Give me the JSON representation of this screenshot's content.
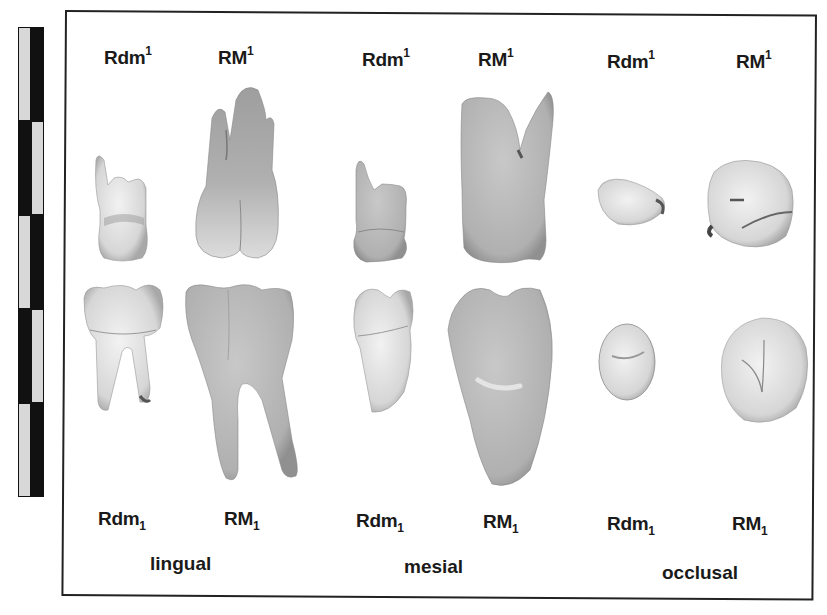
{
  "figure": {
    "scale_bar": {
      "segments": 5,
      "colors": {
        "dark": "#111111",
        "light": "#d8d8d8"
      }
    },
    "upper_labels": [
      {
        "base": "Rdm",
        "sup": "1"
      },
      {
        "base": "RM",
        "sup": "1"
      },
      {
        "base": "Rdm",
        "sup": "1"
      },
      {
        "base": "RM",
        "sup": "1"
      },
      {
        "base": "Rdm",
        "sup": "1"
      },
      {
        "base": "RM",
        "sup": "1"
      }
    ],
    "lower_labels": [
      {
        "base": "Rdm",
        "sub": "1"
      },
      {
        "base": "RM",
        "sub": "1"
      },
      {
        "base": "Rdm",
        "sub": "1"
      },
      {
        "base": "RM",
        "sub": "1"
      },
      {
        "base": "Rdm",
        "sub": "1"
      },
      {
        "base": "RM",
        "sub": "1"
      }
    ],
    "views": [
      {
        "label": "lingual"
      },
      {
        "label": "mesial"
      },
      {
        "label": "occlusal"
      }
    ],
    "specimens": [
      {
        "name": "Rdm1 upper deciduous molar",
        "view": "lingual",
        "row": "upper"
      },
      {
        "name": "RM1 upper first molar",
        "view": "lingual",
        "row": "upper"
      },
      {
        "name": "Rdm1 lower deciduous molar",
        "view": "lingual",
        "row": "lower"
      },
      {
        "name": "RM1 lower first molar",
        "view": "lingual",
        "row": "lower"
      },
      {
        "name": "Rdm1 upper deciduous molar",
        "view": "mesial",
        "row": "upper"
      },
      {
        "name": "RM1 upper first molar",
        "view": "mesial",
        "row": "upper"
      },
      {
        "name": "Rdm1 lower deciduous molar",
        "view": "mesial",
        "row": "lower"
      },
      {
        "name": "RM1 lower first molar",
        "view": "mesial",
        "row": "lower"
      },
      {
        "name": "Rdm1 upper deciduous molar",
        "view": "occlusal",
        "row": "upper"
      },
      {
        "name": "RM1 upper first molar",
        "view": "occlusal",
        "row": "upper"
      },
      {
        "name": "Rdm1 lower deciduous molar",
        "view": "occlusal",
        "row": "lower"
      },
      {
        "name": "RM1 lower first molar",
        "view": "occlusal",
        "row": "lower"
      }
    ],
    "colors": {
      "frame": "#222222",
      "tooth_light": "#e6e6e6",
      "tooth_mid": "#b4b4b4",
      "tooth_dark": "#8c8c8c",
      "text": "#1a1a1a"
    }
  }
}
